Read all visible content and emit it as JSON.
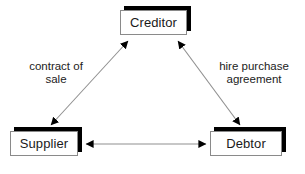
{
  "diagram": {
    "background_color": "#ffffff",
    "line_color": "#8f8f8f",
    "arrowhead_color": "#000000",
    "shadow_color": "#000000",
    "box_fill_color": "#ffffff",
    "box_border_color": "#8a8a8a",
    "text_color": "#1a1a1a",
    "nodes": [
      {
        "id": "creditor",
        "label": "Creditor",
        "x": 120,
        "y": 10,
        "width": 67,
        "height": 25
      },
      {
        "id": "supplier",
        "label": "Supplier",
        "x": 10,
        "y": 131,
        "width": 68,
        "height": 25
      },
      {
        "id": "debtor",
        "label": "Debtor",
        "x": 210,
        "y": 131,
        "width": 72,
        "height": 25
      }
    ],
    "edges": [
      {
        "id": "supplier-creditor",
        "from": "supplier",
        "to": "creditor",
        "label": "contract of\nsale",
        "direction": "both",
        "x1": 51,
        "y1": 125,
        "x2": 128,
        "y2": 41
      },
      {
        "id": "creditor-debtor",
        "from": "creditor",
        "to": "debtor",
        "label": "hire purchase\nagreement",
        "direction": "both",
        "x1": 178,
        "y1": 41,
        "x2": 240,
        "y2": 125
      },
      {
        "id": "supplier-debtor",
        "from": "supplier",
        "to": "debtor",
        "label": "",
        "direction": "both",
        "x1": 86,
        "y1": 144,
        "x2": 206,
        "y2": 144
      }
    ]
  }
}
